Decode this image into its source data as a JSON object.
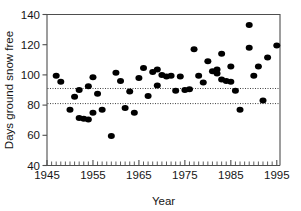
{
  "chart_data": {
    "type": "scatter",
    "title": "",
    "xlabel": "Year",
    "ylabel": "Days ground snow free",
    "xlim": [
      1945,
      1995.7
    ],
    "ylim": [
      40,
      140
    ],
    "xticks": [
      1945,
      1955,
      1965,
      1975,
      1985,
      1995
    ],
    "xtick_labels": [
      "1945",
      "1955",
      "1965",
      "1975",
      "1985",
      "1995"
    ],
    "yticks": [
      40,
      60,
      80,
      100,
      120,
      140
    ],
    "ytick_labels": [
      "40",
      "60",
      "80",
      "100",
      "120",
      "140"
    ],
    "x_minor_tick_interval": 1,
    "grid": false,
    "legend": null,
    "marker": "filled-circle",
    "marker_color": "#000000",
    "reference_lines": [
      {
        "orientation": "horizontal",
        "value": 91,
        "style": "dotted"
      },
      {
        "orientation": "horizontal",
        "value": 81,
        "style": "dotted"
      }
    ],
    "points": [
      {
        "x": 1947,
        "y": 99.5
      },
      {
        "x": 1948,
        "y": 95.5
      },
      {
        "x": 1950,
        "y": 77.0
      },
      {
        "x": 1951,
        "y": 85.5
      },
      {
        "x": 1952,
        "y": 90.0
      },
      {
        "x": 1952,
        "y": 71.5
      },
      {
        "x": 1953,
        "y": 71.0
      },
      {
        "x": 1954,
        "y": 70.5
      },
      {
        "x": 1954,
        "y": 92.5
      },
      {
        "x": 1955,
        "y": 98.5
      },
      {
        "x": 1955,
        "y": 75.0
      },
      {
        "x": 1956,
        "y": 87.5
      },
      {
        "x": 1957,
        "y": 77.0
      },
      {
        "x": 1959,
        "y": 59.5
      },
      {
        "x": 1960,
        "y": 101.5
      },
      {
        "x": 1961,
        "y": 96.0
      },
      {
        "x": 1962,
        "y": 78.0
      },
      {
        "x": 1963,
        "y": 89.0
      },
      {
        "x": 1964,
        "y": 75.0
      },
      {
        "x": 1965,
        "y": 98.0
      },
      {
        "x": 1966,
        "y": 104.5
      },
      {
        "x": 1967,
        "y": 86.0
      },
      {
        "x": 1968,
        "y": 102.0
      },
      {
        "x": 1969,
        "y": 103.5
      },
      {
        "x": 1969,
        "y": 93.0
      },
      {
        "x": 1970,
        "y": 100.0
      },
      {
        "x": 1971,
        "y": 99.0
      },
      {
        "x": 1972,
        "y": 99.5
      },
      {
        "x": 1973,
        "y": 89.5
      },
      {
        "x": 1974,
        "y": 99.0
      },
      {
        "x": 1975,
        "y": 90.0
      },
      {
        "x": 1976,
        "y": 90.5
      },
      {
        "x": 1977,
        "y": 117.0
      },
      {
        "x": 1978,
        "y": 99.5
      },
      {
        "x": 1979,
        "y": 95.0
      },
      {
        "x": 1980,
        "y": 109.0
      },
      {
        "x": 1981,
        "y": 102.5
      },
      {
        "x": 1982,
        "y": 103.5
      },
      {
        "x": 1982,
        "y": 101.0
      },
      {
        "x": 1983,
        "y": 114.0
      },
      {
        "x": 1983,
        "y": 97.0
      },
      {
        "x": 1984,
        "y": 96.0
      },
      {
        "x": 1985,
        "y": 95.5
      },
      {
        "x": 1985,
        "y": 105.5
      },
      {
        "x": 1986,
        "y": 89.5
      },
      {
        "x": 1987,
        "y": 77.0
      },
      {
        "x": 1989,
        "y": 133.0
      },
      {
        "x": 1989,
        "y": 118.0
      },
      {
        "x": 1990,
        "y": 99.5
      },
      {
        "x": 1991,
        "y": 105.5
      },
      {
        "x": 1992,
        "y": 83.0
      },
      {
        "x": 1993,
        "y": 111.5
      },
      {
        "x": 1995,
        "y": 119.5
      }
    ]
  }
}
